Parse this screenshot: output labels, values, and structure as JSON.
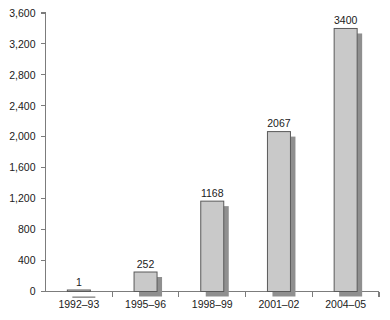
{
  "chart_data": {
    "type": "bar",
    "title": "",
    "subtitle": "",
    "xlabel": "",
    "ylabel": "",
    "categories": [
      "1992–93",
      "1995–96",
      "1998–99",
      "2001–02",
      "2004–05"
    ],
    "values": [
      1,
      252,
      1168,
      2067,
      3400
    ],
    "value_labels": [
      "1",
      "252",
      "1168",
      "2067",
      "3400"
    ],
    "series": [
      {
        "name": "",
        "values": [
          1,
          252,
          1168,
          2067,
          3400
        ]
      }
    ],
    "ylim": [
      0,
      3600
    ],
    "ytick_step": 400,
    "ytick_labels": [
      "0",
      "400",
      "800",
      "1,200",
      "1,600",
      "2,000",
      "2,400",
      "2,800",
      "3,200",
      "3,600"
    ],
    "ytick_values": [
      0,
      400,
      800,
      1200,
      1600,
      2000,
      2400,
      2800,
      3200,
      3600
    ],
    "grid": false,
    "legend": false,
    "legend_position": "none",
    "bar_fill_color": "#c9c9c9",
    "bar_border_color": "#5a5a5a",
    "bar_shadow_color": "#8f8f8f",
    "axis_color": "#7c7c7c",
    "text_color": "#1a1a1a"
  }
}
